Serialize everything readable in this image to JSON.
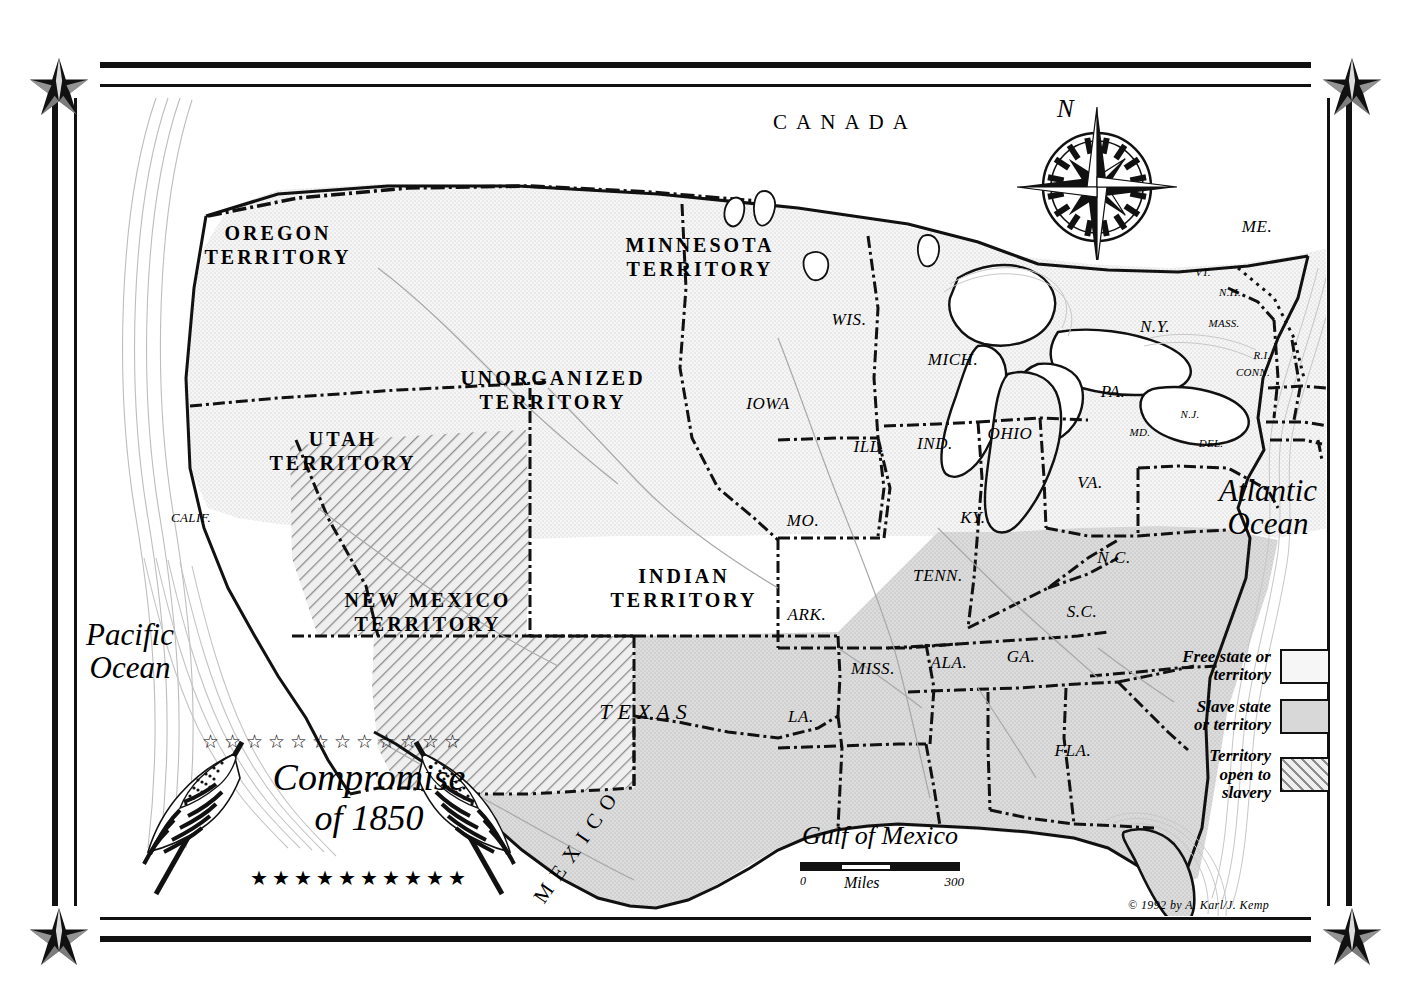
{
  "map": {
    "title_line1": "Compromise",
    "title_line2": "of 1850",
    "stars_top": "☆☆☆☆☆☆☆☆☆☆☆☆",
    "stars_bottom": "★★★★★★★★★★",
    "copyright": "© 1992 by A. Karl/J. Kemp",
    "compass_label": "N",
    "scale": {
      "min": "0",
      "unit": "Miles",
      "max": "300"
    },
    "countries": [
      {
        "name": "CANADA",
        "x": 845,
        "y": 122
      },
      {
        "name": "MEXICO",
        "x": 578,
        "y": 845,
        "rotate": -55
      }
    ],
    "oceans": [
      {
        "line1": "Pacific",
        "line2": "Ocean",
        "x": 130,
        "y": 652
      },
      {
        "line1": "Atlantic",
        "line2": "Ocean",
        "x": 1268,
        "y": 508
      }
    ],
    "gulf": {
      "name": "Gulf of Mexico",
      "x": 880,
      "y": 836
    },
    "legend": [
      {
        "label_line1": "Free state or",
        "label_line2": "territory",
        "swatch": "free"
      },
      {
        "label_line1": "Slave state",
        "label_line2": "or territory",
        "swatch": "slave"
      },
      {
        "label_line1": "Territory",
        "label_line2": "open to",
        "label_line3": "slavery",
        "swatch": "open"
      }
    ],
    "territories": [
      {
        "line1": "OREGON",
        "line2": "TERRITORY",
        "x": 278,
        "y": 246,
        "status": "free"
      },
      {
        "line1": "MINNESOTA",
        "line2": "TERRITORY",
        "x": 700,
        "y": 258,
        "status": "free"
      },
      {
        "line1": "UNORGANIZED",
        "line2": "TERRITORY",
        "x": 553,
        "y": 391,
        "status": "free"
      },
      {
        "line1": "UTAH",
        "line2": "TERRITORY",
        "x": 343,
        "y": 452,
        "status": "open"
      },
      {
        "line1": "NEW MEXICO",
        "line2": "TERRITORY",
        "x": 428,
        "y": 613,
        "status": "open"
      },
      {
        "line1": "INDIAN",
        "line2": "TERRITORY",
        "x": 684,
        "y": 589,
        "status": "slave"
      }
    ],
    "states": [
      {
        "name": "WIS.",
        "x": 849,
        "y": 320,
        "size": "state",
        "status": "free"
      },
      {
        "name": "MICH.",
        "x": 953,
        "y": 360,
        "size": "state",
        "status": "free"
      },
      {
        "name": "IOWA",
        "x": 768,
        "y": 404,
        "size": "state",
        "status": "free"
      },
      {
        "name": "ILL.",
        "x": 869,
        "y": 447,
        "size": "state",
        "status": "free"
      },
      {
        "name": "IND.",
        "x": 935,
        "y": 444,
        "size": "state",
        "status": "free"
      },
      {
        "name": "OHIO",
        "x": 1010,
        "y": 434,
        "size": "state",
        "status": "free"
      },
      {
        "name": "PA.",
        "x": 1113,
        "y": 392,
        "size": "state",
        "status": "free"
      },
      {
        "name": "N.Y.",
        "x": 1155,
        "y": 327,
        "size": "state",
        "status": "free"
      },
      {
        "name": "ME.",
        "x": 1257,
        "y": 227,
        "size": "state",
        "status": "free"
      },
      {
        "name": "VT.",
        "x": 1203,
        "y": 272,
        "size": "state-xs",
        "status": "free"
      },
      {
        "name": "N.H.",
        "x": 1230,
        "y": 292,
        "size": "state-xs",
        "status": "free"
      },
      {
        "name": "MASS.",
        "x": 1224,
        "y": 323,
        "size": "state-xs",
        "status": "free"
      },
      {
        "name": "R.I.",
        "x": 1262,
        "y": 355,
        "size": "state-xs",
        "status": "free"
      },
      {
        "name": "CONN.",
        "x": 1253,
        "y": 372,
        "size": "state-xs",
        "status": "free"
      },
      {
        "name": "N.J.",
        "x": 1190,
        "y": 414,
        "size": "state-xs",
        "status": "free"
      },
      {
        "name": "MD.",
        "x": 1140,
        "y": 432,
        "size": "state-xs",
        "status": "slave"
      },
      {
        "name": "DEL.",
        "x": 1211,
        "y": 443,
        "size": "state-xs",
        "status": "slave"
      },
      {
        "name": "CALIF.",
        "x": 191,
        "y": 518,
        "size": "state-sm",
        "status": "free"
      },
      {
        "name": "MO.",
        "x": 803,
        "y": 521,
        "size": "state",
        "status": "slave"
      },
      {
        "name": "KY.",
        "x": 973,
        "y": 518,
        "size": "state",
        "status": "slave"
      },
      {
        "name": "VA.",
        "x": 1090,
        "y": 483,
        "size": "state",
        "status": "slave"
      },
      {
        "name": "N.C.",
        "x": 1114,
        "y": 558,
        "size": "state",
        "status": "slave"
      },
      {
        "name": "TENN.",
        "x": 938,
        "y": 576,
        "size": "state",
        "status": "slave"
      },
      {
        "name": "S.C.",
        "x": 1082,
        "y": 612,
        "size": "state",
        "status": "slave"
      },
      {
        "name": "ARK.",
        "x": 807,
        "y": 615,
        "size": "state",
        "status": "slave"
      },
      {
        "name": "MISS.",
        "x": 873,
        "y": 669,
        "size": "state",
        "status": "slave"
      },
      {
        "name": "ALA.",
        "x": 949,
        "y": 663,
        "size": "state",
        "status": "slave"
      },
      {
        "name": "GA.",
        "x": 1021,
        "y": 657,
        "size": "state",
        "status": "slave"
      },
      {
        "name": "LA.",
        "x": 801,
        "y": 717,
        "size": "state",
        "status": "slave"
      },
      {
        "name": "FLA.",
        "x": 1073,
        "y": 751,
        "size": "state",
        "status": "slave"
      },
      {
        "name": "TEXAS",
        "x": 646,
        "y": 712,
        "size": "terr-lg",
        "status": "slave"
      }
    ],
    "colors": {
      "free": "#f4f4f4",
      "slave": "#d9d9d9",
      "open": "#ededed",
      "ink": "#111111",
      "paper": "#ffffff"
    }
  }
}
